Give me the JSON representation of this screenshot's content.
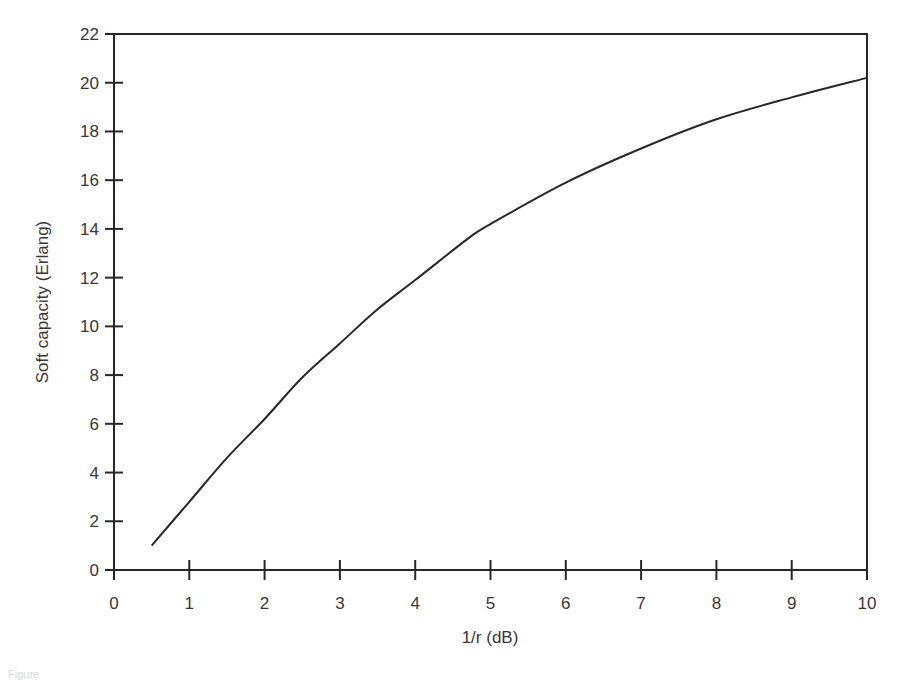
{
  "chart_data": {
    "type": "line",
    "title": "",
    "xlabel": "1/r (dB)",
    "ylabel": "Soft capacity (Erlang)",
    "xlim": [
      0,
      10
    ],
    "ylim": [
      0,
      22
    ],
    "x_ticks": [
      "0",
      "1",
      "2",
      "3",
      "4",
      "5",
      "6",
      "7",
      "8",
      "9",
      "10"
    ],
    "y_ticks": [
      "0",
      "2",
      "4",
      "6",
      "8",
      "10",
      "12",
      "14",
      "16",
      "18",
      "20",
      "22"
    ],
    "grid": false,
    "legend": null,
    "series": [
      {
        "name": "Soft capacity",
        "color": "#2a2626",
        "x": [
          0.5,
          1,
          1.5,
          2,
          2.5,
          3,
          3.5,
          4,
          4.7,
          5,
          6,
          7,
          8,
          9,
          10
        ],
        "values": [
          1.0,
          2.8,
          4.6,
          6.2,
          7.9,
          9.3,
          10.7,
          11.9,
          13.6,
          14.2,
          15.9,
          17.3,
          18.5,
          19.4,
          20.2
        ]
      }
    ]
  },
  "caption": "Figure"
}
